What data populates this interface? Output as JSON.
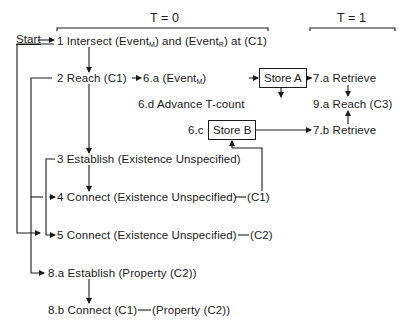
{
  "header": {
    "t0_label": "T = 0",
    "t1_label": "T = 1"
  },
  "start_label": "Start",
  "nodes": {
    "n1": {
      "prefix": "1 Intersect (Event",
      "sub1": "M",
      "mid": ") and (Event",
      "sub2": "R",
      "suffix": ") at (C1)"
    },
    "n2": {
      "label": "2 Reach (C1)"
    },
    "n6a": {
      "prefix": "6.a (Event",
      "sub": "M",
      "suffix": ")"
    },
    "storeA": {
      "label": "Store A"
    },
    "n6d": {
      "label": "6.d Advance T-count"
    },
    "n6c": {
      "label": "6.c"
    },
    "storeB": {
      "label": "Store B"
    },
    "n7a": {
      "label": "7.a Retrieve"
    },
    "n9a": {
      "label": "9.a Reach (C3)"
    },
    "n7b": {
      "label": "7.b Retrieve"
    },
    "n3": {
      "label": "3 Establish (Existence Unspecified)"
    },
    "n4": {
      "label": "4 Connect (Existence Unspecified)",
      "tail": "(C1)"
    },
    "n5": {
      "label": "5 Connect (Existence Unspecified)",
      "tail": "(C2)"
    },
    "n8a": {
      "label": "8.a Establish (Property (C2))"
    },
    "n8b": {
      "label": "8.b Connect (C1)",
      "tail": "(Property (C2))"
    }
  },
  "colors": {
    "ink": "#1a1a1a",
    "background": "#ffffff"
  }
}
